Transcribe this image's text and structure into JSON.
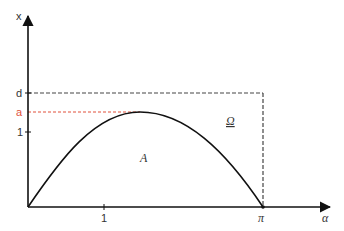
{
  "diagram": {
    "axes": {
      "y_label": "x",
      "x_label": "α",
      "y_ticks": [
        {
          "label": "d",
          "color": "#333333"
        },
        {
          "label": "a",
          "color": "#e0503a"
        },
        {
          "label": "1",
          "color": "#333333"
        }
      ],
      "x_ticks": [
        {
          "label": "1"
        },
        {
          "label": "π"
        }
      ]
    },
    "regions": {
      "under_curve": "A",
      "rectangle": "Ω"
    },
    "colors": {
      "axis": "#222222",
      "curve": "#111111",
      "dashed_rect": "#444444",
      "a_line": "#e0503a"
    }
  }
}
